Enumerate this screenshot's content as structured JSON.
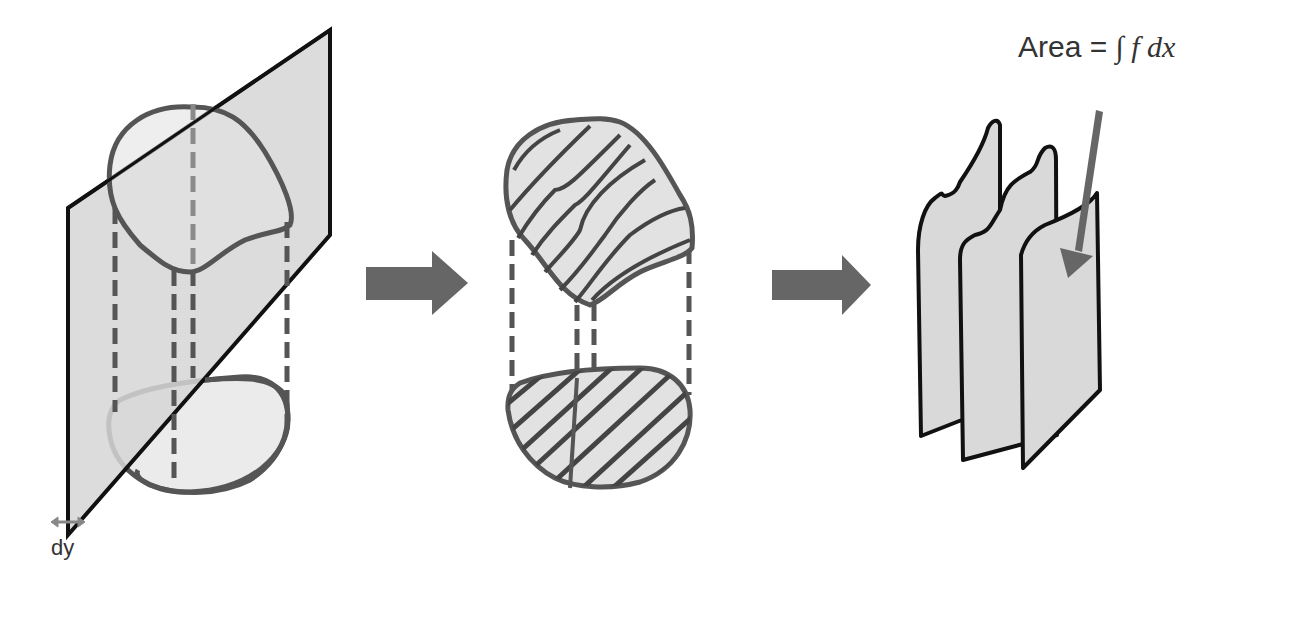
{
  "diagram": {
    "colors": {
      "plane_fill": "#d9d9d9",
      "plane_stroke": "#111111",
      "shape_stroke": "#555555",
      "dash_stroke": "#555555",
      "dash_light": "#8a8a8a",
      "arrow_fill": "#666666",
      "slice_fill": "#d9d9d9",
      "slice_stroke": "#111111",
      "text": "#333333"
    },
    "panels": [
      {
        "id": "slicing-plane",
        "label": "dy",
        "arrow_hint": "double-headed arrow marking plane thickness"
      },
      {
        "id": "hatched-cross-sections"
      },
      {
        "id": "stacked-slices",
        "label_prefix": "Area = ",
        "label_math": "∫ f dx"
      }
    ],
    "arrows": [
      {
        "id": "arrow-1",
        "from": "slicing-plane",
        "to": "hatched-cross-sections"
      },
      {
        "id": "arrow-2",
        "from": "hatched-cross-sections",
        "to": "stacked-slices"
      }
    ]
  }
}
